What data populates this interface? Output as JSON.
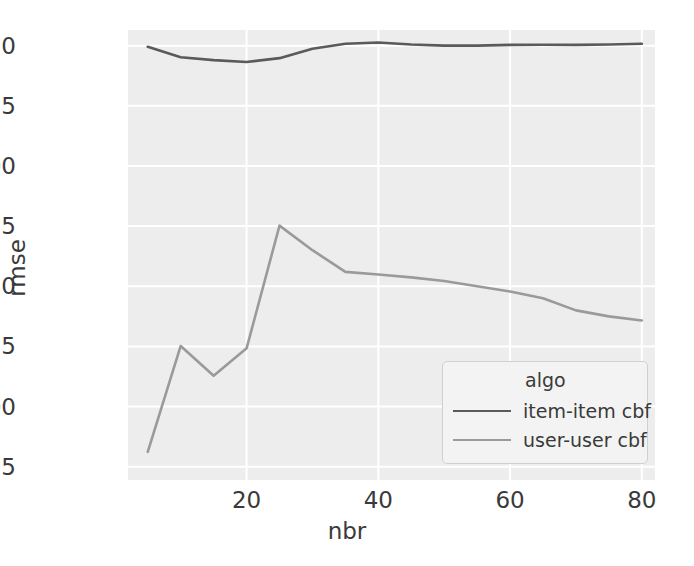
{
  "chart_data": {
    "type": "line",
    "title": "",
    "xlabel": "nbr",
    "ylabel": "rmse",
    "xlim": [
      2,
      82
    ],
    "ylim": [
      0.7695,
      0.9565
    ],
    "grid": true,
    "legend_position": "lower right",
    "legend_title": "algo",
    "x_ticks": [
      "20",
      "40",
      "60",
      "80"
    ],
    "x_tick_values": [
      20,
      40,
      60,
      80
    ],
    "y_ticks": [
      "0.775",
      "0.800",
      "0.825",
      "0.850",
      "0.875",
      "0.900",
      "0.925",
      "0.950"
    ],
    "y_tick_values": [
      0.775,
      0.8,
      0.825,
      0.85,
      0.875,
      0.9,
      0.925,
      0.95
    ],
    "x": [
      5,
      10,
      15,
      20,
      25,
      30,
      35,
      40,
      45,
      50,
      55,
      60,
      65,
      70,
      75,
      80
    ],
    "series": [
      {
        "name": "item-item cbf",
        "color": "#5a5a5a",
        "values": [
          0.9495,
          0.9452,
          0.944,
          0.9432,
          0.9448,
          0.9487,
          0.9508,
          0.9513,
          0.9505,
          0.95,
          0.95,
          0.9503,
          0.9504,
          0.9503,
          0.9505,
          0.9508
        ]
      },
      {
        "name": "user-user cbf",
        "color": "#9a9a9a",
        "values": [
          0.7812,
          0.8252,
          0.8128,
          0.8242,
          0.8752,
          0.865,
          0.856,
          0.8549,
          0.8537,
          0.8522,
          0.85,
          0.8478,
          0.845,
          0.84,
          0.8375,
          0.8358
        ]
      }
    ],
    "colors": {
      "plot_background": "#ededed",
      "grid_line": "#ffffff",
      "figure_background": "#ffffff",
      "text": "#3a3a3a"
    }
  }
}
